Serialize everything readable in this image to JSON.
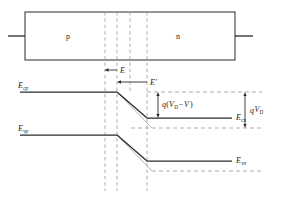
{
  "figure": {
    "type": "pn-junction-band-diagram",
    "device": {
      "region_left_label": "p",
      "region_right_label": "n",
      "box": {
        "x": 25,
        "y": 12,
        "width": 210,
        "height": 48
      },
      "lead_left": {
        "x1": 8,
        "x2": 25,
        "y": 36
      },
      "lead_right": {
        "x1": 235,
        "x2": 253,
        "y": 36
      }
    },
    "field_arrows": [
      {
        "name": "E",
        "label": "E",
        "x_tail": 117,
        "x_head": 105,
        "y": 70,
        "label_x": 120,
        "label_y": 71
      },
      {
        "name": "E-prime",
        "label": "E′",
        "x_tail": 147,
        "x_head": 117,
        "y": 82,
        "label_x": 150,
        "label_y": 83
      }
    ],
    "band_labels": {
      "ecp": "E",
      "ecp_sub": "cp",
      "evp": "E",
      "evp_sub": "vp",
      "ecn": "E",
      "ecn_sub": "cn",
      "evn": "E",
      "evn_sub": "vn"
    },
    "energy_labels": {
      "bias_gap": {
        "q": "q",
        "open": "(",
        "V": "V",
        "Vsub": "D",
        "minus": "−",
        "V2": "V",
        "close": ")"
      },
      "builtin_gap": {
        "q": "q",
        "V": "V",
        "Vsub": "D"
      }
    },
    "depletion_lines_x": [
      105,
      117,
      130,
      147
    ],
    "bands": {
      "ec_p_level_y": 92,
      "ec_n_level_y": 118,
      "ev_p_level_y": 135,
      "ev_n_level_y": 161,
      "ec_zero_bias_n_y": 128,
      "ev_zero_bias_n_y": 171,
      "slope_start_x": 117,
      "slope_end_x": 147,
      "slope_start_x_light": 117,
      "slope_end_x_light": 152
    },
    "colors": {
      "stroke_dark": "#2a2a2a",
      "stroke_light": "#a9a9a9",
      "dash_gray": "#9a9a9a",
      "text": "#1b1b1b",
      "background": "#ffffff"
    }
  }
}
